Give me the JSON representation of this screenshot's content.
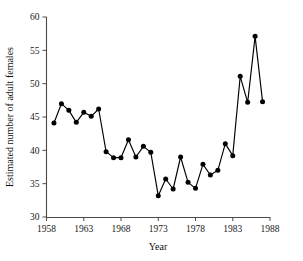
{
  "chart_data": {
    "type": "line",
    "title": "",
    "xlabel": "Year",
    "ylabel": "Estimated number of adult females",
    "xlim": [
      1958,
      1988
    ],
    "ylim": [
      30,
      60
    ],
    "grid": false,
    "legend": null,
    "xticks": [
      1958,
      1963,
      1968,
      1973,
      1978,
      1983,
      1988
    ],
    "yticks": [
      30,
      35,
      40,
      45,
      50,
      55,
      60
    ],
    "marker": "filled-circle",
    "x": [
      1959,
      1960,
      1961,
      1962,
      1963,
      1964,
      1965,
      1966,
      1967,
      1968,
      1969,
      1970,
      1971,
      1972,
      1973,
      1974,
      1975,
      1976,
      1977,
      1978,
      1979,
      1980,
      1981,
      1982,
      1983,
      1984,
      1985,
      1986,
      1987
    ],
    "values": [
      44.1,
      47.0,
      46.0,
      44.2,
      45.7,
      45.1,
      46.2,
      39.8,
      38.9,
      38.9,
      41.6,
      39.0,
      40.6,
      39.7,
      33.2,
      35.7,
      34.2,
      39.0,
      35.2,
      34.3,
      37.9,
      36.3,
      37.0,
      41.0,
      39.2,
      51.1,
      47.2,
      57.1,
      47.3
    ],
    "series": [
      {
        "name": "Estimated number of adult females",
        "values": [
          44.1,
          47.0,
          46.0,
          44.2,
          45.7,
          45.1,
          46.2,
          39.8,
          38.9,
          38.9,
          41.6,
          39.0,
          40.6,
          39.7,
          33.2,
          35.7,
          34.2,
          39.0,
          35.2,
          34.3,
          37.9,
          36.3,
          37.0,
          41.0,
          39.2,
          51.1,
          47.2,
          57.1,
          47.3
        ]
      }
    ]
  },
  "axes": {
    "x_title": "Year",
    "y_title": "Estimated number of adult females",
    "x_tick_labels": [
      "1958",
      "1963",
      "1968",
      "1973",
      "1978",
      "1983",
      "1988"
    ],
    "y_tick_labels": [
      "30",
      "35",
      "40",
      "45",
      "50",
      "55",
      "60"
    ]
  },
  "colors": {
    "line": "#000000",
    "marker": "#000000",
    "axis": "#4a4a4a",
    "background": "#ffffff"
  }
}
